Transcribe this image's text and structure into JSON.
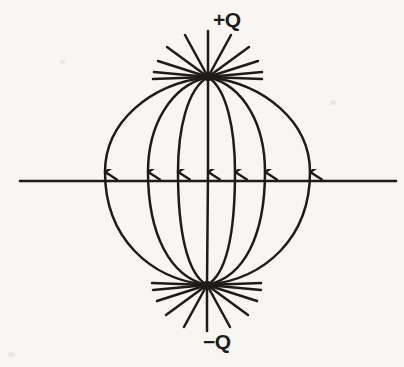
{
  "figure": {
    "domain": "Diagram",
    "background_color": "#f7f6f2",
    "ink_color": "#1d1c1a",
    "width": 404,
    "height": 367
  },
  "labels": {
    "positive_charge": "+Q",
    "negative_charge": "−Q"
  },
  "charges": [
    {
      "name": "positive",
      "label": "+Q",
      "x": 208,
      "y": 77,
      "sign": "+"
    },
    {
      "name": "negative",
      "label": "−Q",
      "x": 207,
      "y": 285,
      "sign": "−"
    }
  ],
  "axis_line": {
    "name": "horizontal-axis",
    "y": 181,
    "x_start": 20,
    "x_end": 396
  },
  "field_lines": {
    "count": 7,
    "arrow_direction": "down",
    "arrow_x_positions": [
      105,
      148,
      178,
      208,
      235,
      265,
      310
    ],
    "bulge_offsets": [
      -103,
      -60,
      -30,
      0,
      28,
      58,
      102
    ]
  },
  "radiating_stubs": {
    "top_count": 11,
    "bottom_count": 11,
    "stub_length": 40
  }
}
